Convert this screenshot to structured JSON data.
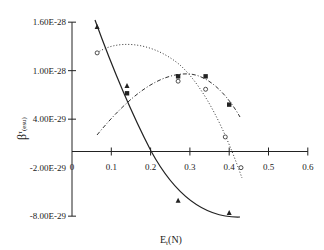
{
  "chart_data": {
    "type": "scatter",
    "title": "",
    "xlabel": "Et(N)",
    "ylabel": "β^τ (esu)",
    "xlim": [
      0,
      0.6
    ],
    "ylim": [
      -8e-29,
      1.6e-28
    ],
    "x_ticks": [
      "0",
      "0.1",
      "0.2",
      "0.3",
      "0.4",
      "0.5",
      "0.6"
    ],
    "y_ticks": [
      "1.60E-28",
      "1.00E-28",
      "4.00E-29",
      "-2.00E-29",
      "-8.00E-29"
    ],
    "grid": false,
    "legend": null,
    "series": [
      {
        "name": "triangles",
        "marker": "triangle",
        "fit": "solid",
        "points": [
          [
            0.064,
            1.54e-28
          ],
          [
            0.14,
            8.1e-29
          ],
          [
            0.27,
            -6.1e-29
          ],
          [
            0.4,
            -7.6e-29
          ]
        ]
      },
      {
        "name": "squares",
        "marker": "square",
        "fit": "dash-dot",
        "points": [
          [
            0.14,
            7.2e-29
          ],
          [
            0.27,
            9.3e-29
          ],
          [
            0.34,
            9.3e-29
          ],
          [
            0.4,
            5.8e-29
          ]
        ]
      },
      {
        "name": "circles",
        "marker": "open-circle",
        "fit": "dotted",
        "points": [
          [
            0.064,
            1.22e-28
          ],
          [
            0.27,
            8.7e-29
          ],
          [
            0.34,
            7.7e-29
          ],
          [
            0.39,
            1.8e-29
          ],
          [
            0.43,
            -2e-29
          ]
        ]
      }
    ]
  },
  "labels": {
    "xlabel_main": "E",
    "xlabel_sub": "t",
    "xlabel_rest": "(N)",
    "ylabel_main": "β",
    "ylabel_sup": "τ",
    "ylabel_unit": "(esu)"
  }
}
